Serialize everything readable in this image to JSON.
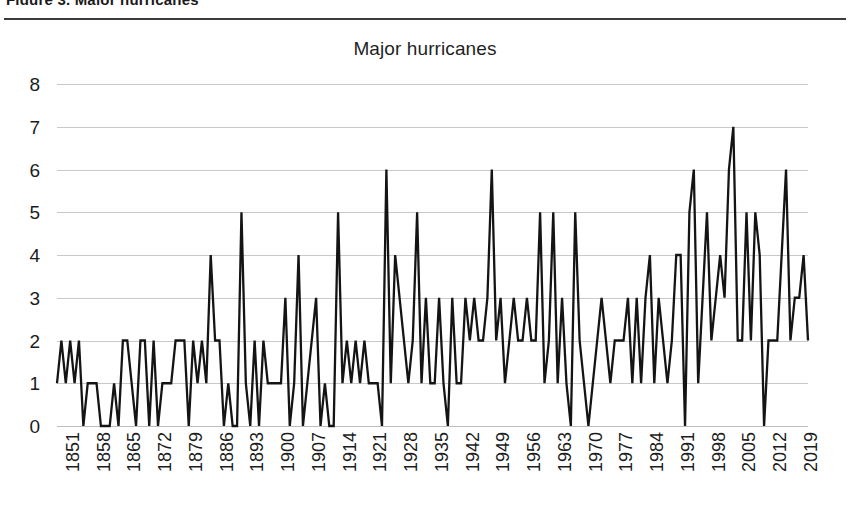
{
  "page": {
    "top_fragment": "Figure 3. Major hurricanes"
  },
  "chart_data": {
    "type": "line",
    "title": "Major hurricanes",
    "xlabel": "",
    "ylabel": "",
    "ylim": [
      0,
      8
    ],
    "ytick_step": 1,
    "yticks": [
      "8",
      "7",
      "6",
      "5",
      "4",
      "3",
      "2",
      "1",
      "0"
    ],
    "grid": true,
    "legend": "none",
    "xticks": [
      "1851",
      "1858",
      "1865",
      "1872",
      "1879",
      "1886",
      "1893",
      "1900",
      "1907",
      "1914",
      "1921",
      "1928",
      "1935",
      "1942",
      "1949",
      "1956",
      "1963",
      "1970",
      "1977",
      "1984",
      "1991",
      "1998",
      "2005",
      "2012",
      "2019"
    ],
    "xtick_step": 7,
    "x_start": 1851,
    "x_end": 2022,
    "series_name": "Major hurricanes",
    "series_color": "#141414",
    "x": [
      1851,
      1852,
      1853,
      1854,
      1855,
      1856,
      1857,
      1858,
      1859,
      1860,
      1861,
      1862,
      1863,
      1864,
      1865,
      1866,
      1867,
      1868,
      1869,
      1870,
      1871,
      1872,
      1873,
      1874,
      1875,
      1876,
      1877,
      1878,
      1879,
      1880,
      1881,
      1882,
      1883,
      1884,
      1885,
      1886,
      1887,
      1888,
      1889,
      1890,
      1891,
      1892,
      1893,
      1894,
      1895,
      1896,
      1897,
      1898,
      1899,
      1900,
      1901,
      1902,
      1903,
      1904,
      1905,
      1906,
      1907,
      1908,
      1909,
      1910,
      1911,
      1912,
      1913,
      1914,
      1915,
      1916,
      1917,
      1918,
      1919,
      1920,
      1921,
      1922,
      1923,
      1924,
      1925,
      1926,
      1927,
      1928,
      1929,
      1930,
      1931,
      1932,
      1933,
      1934,
      1935,
      1936,
      1937,
      1938,
      1939,
      1940,
      1941,
      1942,
      1943,
      1944,
      1945,
      1946,
      1947,
      1948,
      1949,
      1950,
      1951,
      1952,
      1953,
      1954,
      1955,
      1956,
      1957,
      1958,
      1959,
      1960,
      1961,
      1962,
      1963,
      1964,
      1965,
      1966,
      1967,
      1968,
      1969,
      1970,
      1971,
      1972,
      1973,
      1974,
      1975,
      1976,
      1977,
      1978,
      1979,
      1980,
      1981,
      1982,
      1983,
      1984,
      1985,
      1986,
      1987,
      1988,
      1989,
      1990,
      1991,
      1992,
      1993,
      1994,
      1995,
      1996,
      1997,
      1998,
      1999,
      2000,
      2001,
      2002,
      2003,
      2004,
      2005,
      2006,
      2007,
      2008,
      2009,
      2010,
      2011,
      2012,
      2013,
      2014,
      2015,
      2016,
      2017,
      2018,
      2019,
      2020,
      2021,
      2022
    ],
    "values": [
      1,
      2,
      1,
      2,
      1,
      2,
      0,
      1,
      1,
      1,
      0,
      0,
      0,
      1,
      0,
      2,
      2,
      1,
      0,
      2,
      2,
      0,
      2,
      0,
      1,
      1,
      1,
      2,
      2,
      2,
      0,
      2,
      1,
      2,
      1,
      4,
      2,
      2,
      0,
      1,
      0,
      0,
      5,
      1,
      0,
      2,
      0,
      2,
      1,
      1,
      1,
      1,
      3,
      0,
      1,
      4,
      0,
      1,
      2,
      3,
      0,
      1,
      0,
      0,
      5,
      1,
      2,
      1,
      2,
      1,
      2,
      1,
      1,
      1,
      0,
      6,
      1,
      4,
      3,
      2,
      1,
      2,
      5,
      1,
      3,
      1,
      1,
      3,
      1,
      0,
      3,
      1,
      1,
      3,
      2,
      3,
      2,
      2,
      3,
      6,
      2,
      3,
      1,
      2,
      3,
      2,
      2,
      3,
      2,
      2,
      5,
      1,
      2,
      5,
      1,
      3,
      1,
      0,
      5,
      2,
      1,
      0,
      1,
      2,
      3,
      2,
      1,
      2,
      2,
      2,
      3,
      1,
      3,
      1,
      3,
      4,
      1,
      3,
      2,
      1,
      2,
      4,
      4,
      0,
      5,
      6,
      1,
      3,
      5,
      2,
      3,
      4,
      3,
      6,
      7,
      2,
      2,
      5,
      2,
      5,
      4,
      0,
      2,
      2,
      2,
      4,
      6,
      2,
      3,
      3,
      4,
      2
    ]
  }
}
